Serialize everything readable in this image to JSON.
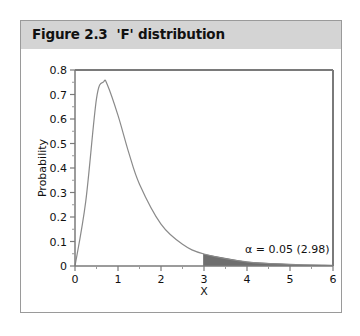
{
  "figure": {
    "title": "Figure 2.3  'F' distribution"
  },
  "chart_data": {
    "type": "area",
    "title": "Figure 2.3 'F' distribution",
    "xlabel": "X",
    "ylabel": "Probability",
    "xlim": [
      0,
      6
    ],
    "ylim": [
      0,
      0.8
    ],
    "xticks": [
      0,
      1,
      2,
      3,
      4,
      5,
      6
    ],
    "yticks": [
      0,
      0.1,
      0.2,
      0.3,
      0.4,
      0.5,
      0.6,
      0.7,
      0.8
    ],
    "grid": false,
    "series": [
      {
        "name": "F density",
        "x": [
          0,
          0.25,
          0.5,
          0.667,
          0.75,
          1,
          1.25,
          1.5,
          2,
          2.5,
          3,
          4,
          5,
          6
        ],
        "values": [
          0,
          0.264,
          0.683,
          0.752,
          0.741,
          0.615,
          0.463,
          0.334,
          0.171,
          0.089,
          0.049,
          0.017,
          0.007,
          0.003
        ]
      }
    ],
    "shaded_region": {
      "from": 2.98,
      "to": 6,
      "color": "#6e6e6e"
    },
    "annotations": [
      {
        "text": "α = 0.05 (2.98)",
        "x": 5,
        "y": 0.06
      }
    ]
  },
  "labels": {
    "xlabel": "X",
    "ylabel": "Probability",
    "annotation": "α = 0.05 (2.98)",
    "xticks": [
      "0",
      "1",
      "2",
      "3",
      "4",
      "5",
      "6"
    ],
    "yticks": [
      "0",
      "0.1",
      "0.2",
      "0.3",
      "0.4",
      "0.5",
      "0.6",
      "0.7",
      "0.8"
    ]
  },
  "colors": {
    "header_bg": "#d4d4d4",
    "curve": "#8a8a8a",
    "shade": "#6e6e6e",
    "axis": "#7a7a7a"
  }
}
